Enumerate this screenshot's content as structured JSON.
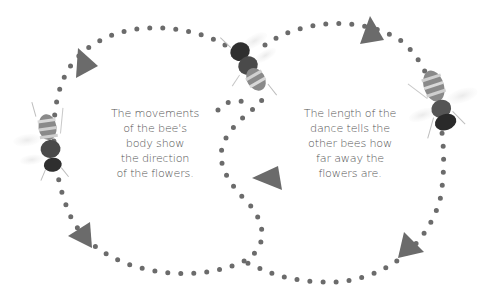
{
  "diagram": {
    "dot_color": "#6b6b6b",
    "arrow_color": "#6b6b6b",
    "text_color": "#555555",
    "captions": {
      "left": {
        "lines": [
          "The movements",
          "of the bee's",
          "body show",
          "the direction",
          "of the flowers."
        ]
      },
      "right": {
        "lines": [
          "The length of the",
          "dance tells the",
          "other bees how",
          "far away the",
          "flowers are."
        ]
      }
    },
    "arrows": [
      {
        "name": "arrow-top-left",
        "direction": "right"
      },
      {
        "name": "arrow-top-right",
        "direction": "up-right"
      },
      {
        "name": "arrow-center",
        "direction": "down"
      },
      {
        "name": "arrow-bottom-left",
        "direction": "left"
      },
      {
        "name": "arrow-bottom-right",
        "direction": "up"
      }
    ],
    "bees": [
      {
        "name": "bee-left",
        "position": "left loop"
      },
      {
        "name": "bee-top-center",
        "position": "crossing point"
      },
      {
        "name": "bee-right",
        "position": "right loop"
      }
    ]
  }
}
